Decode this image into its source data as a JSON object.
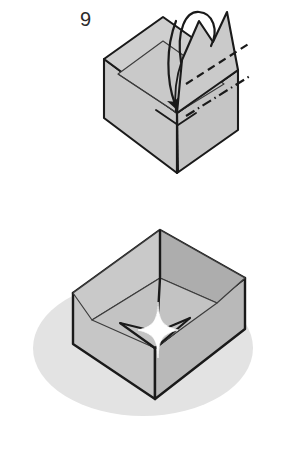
{
  "document": {
    "kind": "origami-instruction-diagram",
    "title": "Origami box folding steps",
    "background_color": "#ffffff"
  },
  "palette": {
    "paper_fill": "#c9c9c9",
    "paper_fill_light": "#d2d2d2",
    "paper_fill_shade": "#b4b4b4",
    "paper_fill_inner": "#bdbdbd",
    "outline": "#1a1a1a",
    "crease_line": "#3c3c3c",
    "shadow": "#e3e3e3",
    "sparkle": "#ffffff",
    "label_color": "#2b2b2b"
  },
  "steps": [
    {
      "id": "step-9",
      "number": "9",
      "figure_name": "open-box-with-upright-flap",
      "description": "Open box with a tall upright flap; curved arrow shows the flap folding forward and down into the box.",
      "annotations": [
        {
          "name": "valley-fold-line",
          "style": "dashed",
          "meaning": "valley fold"
        },
        {
          "name": "mountain-fold-line",
          "style": "dash-dot",
          "meaning": "mountain fold"
        },
        {
          "name": "fold-arrow",
          "style": "curved-arrow",
          "meaning": "fold flap down into box"
        }
      ]
    },
    {
      "id": "step-10",
      "number": "10",
      "figure_name": "finished-box",
      "description": "Completed open box seen from above with a drop shadow and a sparkle at the centre of the inner base.",
      "annotations": [
        {
          "name": "drop-shadow",
          "style": "ellipse",
          "meaning": "ground shadow"
        },
        {
          "name": "sparkle",
          "style": "four-point-star",
          "meaning": "finished highlight"
        }
      ]
    }
  ]
}
